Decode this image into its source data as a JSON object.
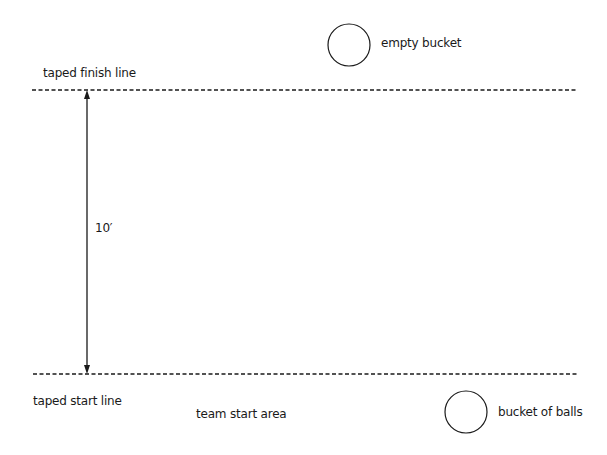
{
  "diagram": {
    "labels": {
      "finish_line": "taped finish line",
      "empty_bucket": "empty bucket",
      "distance": "10′",
      "start_line": "taped start line",
      "team_start_area": "team start area",
      "bucket_of_balls": "bucket of balls"
    },
    "elements": {
      "finish_line": {
        "type": "dashed-line",
        "x1": 32,
        "x2": 578,
        "y": 90
      },
      "start_line": {
        "type": "dashed-line",
        "x1": 33,
        "x2": 578,
        "y": 374
      },
      "distance_arrow": {
        "type": "double-arrow",
        "x": 87,
        "y1": 90,
        "y2": 374,
        "measure": "10 feet"
      },
      "empty_bucket": {
        "type": "circle",
        "cx": 349,
        "cy": 45,
        "r": 21
      },
      "bucket_of_balls": {
        "type": "circle",
        "cx": 466,
        "cy": 412,
        "r": 21
      }
    },
    "colors": {
      "stroke": "#1a1a1a",
      "background": "#ffffff"
    }
  }
}
